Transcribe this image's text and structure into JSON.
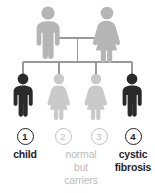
{
  "diagram": {
    "background_color": "#ffffff",
    "line_color": "#9a9a9a",
    "colors": {
      "parent_gray": "#b5b5b5",
      "carrier_gray": "#c9c9c9",
      "affected_dark": "#2a2a2a",
      "caption_gray": "#bdbdbd",
      "caption_dark": "#1f1f1f"
    }
  },
  "parents": [
    {
      "id": "father",
      "sex": "male",
      "status": "carrier",
      "color": "#b5b5b5"
    },
    {
      "id": "mother",
      "sex": "female",
      "status": "carrier",
      "color": "#b5b5b5"
    }
  ],
  "children": [
    {
      "number": "1",
      "sex": "male",
      "status": "affected",
      "color": "#2a2a2a",
      "circle_style": "affected"
    },
    {
      "number": "2",
      "sex": "female",
      "status": "carrier",
      "color": "#c9c9c9",
      "circle_style": "carrier"
    },
    {
      "number": "3",
      "sex": "female",
      "status": "carrier",
      "color": "#c9c9c9",
      "circle_style": "carrier"
    },
    {
      "number": "4",
      "sex": "male",
      "status": "affected",
      "color": "#2a2a2a",
      "circle_style": "affected"
    }
  ],
  "legend": {
    "child_label": "child",
    "carrier_label_line1": "normal",
    "carrier_label_line2": "but",
    "carrier_label_line3": "carriers",
    "affected_label_line1": "cystic",
    "affected_label_line2": "fibrosis"
  }
}
